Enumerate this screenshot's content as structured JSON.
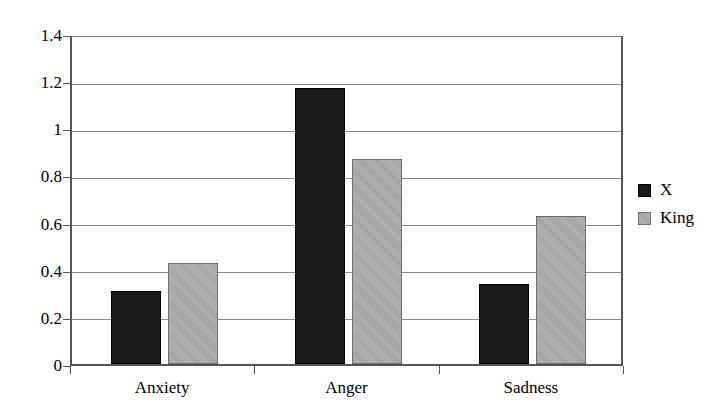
{
  "chart_data": {
    "type": "bar",
    "title": "",
    "subtitle": "",
    "xlabel": "",
    "ylabel": "",
    "categories": [
      "Anxiety",
      "Anger",
      "Sadness"
    ],
    "series": [
      {
        "name": "X",
        "color": "#1a1a1a",
        "values": [
          0.31,
          1.17,
          0.34
        ]
      },
      {
        "name": "King",
        "color": "#a8a8a8",
        "values": [
          0.43,
          0.87,
          0.63
        ]
      }
    ],
    "ylim": [
      0,
      1.4
    ],
    "yticks": [
      0,
      0.2,
      0.4,
      0.6,
      0.8,
      1,
      1.2,
      1.4
    ],
    "ytick_labels": [
      "0",
      "0.2",
      "0.4",
      "0.6",
      "0.8",
      "1",
      "1.2",
      "1.4"
    ],
    "grid": true,
    "grid_axis": "y",
    "legend": true,
    "legend_position": "right",
    "legend_entries": [
      "X",
      "King"
    ],
    "bar_grouping": "grouped"
  }
}
